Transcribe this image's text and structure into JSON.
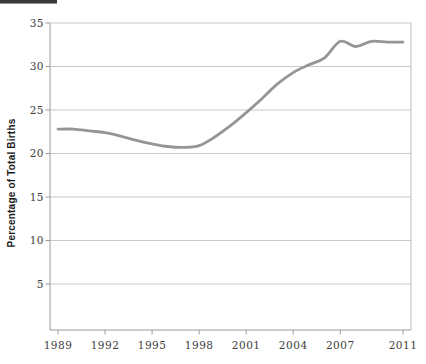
{
  "figure": {
    "top_rule_color": "#3a3a3a"
  },
  "chart_data": {
    "type": "line",
    "title": "",
    "xlabel": "",
    "ylabel": "Percentage of Total Births",
    "x": [
      1989,
      1990,
      1991,
      1992,
      1993,
      1994,
      1995,
      1996,
      1997,
      1998,
      1999,
      2000,
      2001,
      2002,
      2003,
      2004,
      2005,
      2006,
      2007,
      2008,
      2009,
      2010,
      2011
    ],
    "series": [
      {
        "name": "Percentage of Total Births",
        "values": [
          22.8,
          22.8,
          22.6,
          22.4,
          22.0,
          21.5,
          21.1,
          20.8,
          20.7,
          20.9,
          21.9,
          23.2,
          24.7,
          26.3,
          28.0,
          29.3,
          30.2,
          31.0,
          32.9,
          32.3,
          32.9,
          32.8,
          32.8
        ]
      }
    ],
    "x_ticks": [
      1989,
      1992,
      1995,
      1998,
      2001,
      2004,
      2007,
      2011
    ],
    "y_ticks": [
      5,
      10,
      15,
      20,
      25,
      30,
      35
    ],
    "xlim": [
      1989,
      2011
    ],
    "ylim": [
      0,
      35
    ],
    "grid": "horizontal",
    "legend": "none",
    "line_smoothing": "spline",
    "colors": {
      "line": "#959595",
      "grid": "#c9c9c9",
      "axis": "#9a9a9a",
      "frame_right": "#bdbdbd",
      "tick_text": "#3d3d3d",
      "axis_title_text": "#1c1c1c"
    }
  }
}
